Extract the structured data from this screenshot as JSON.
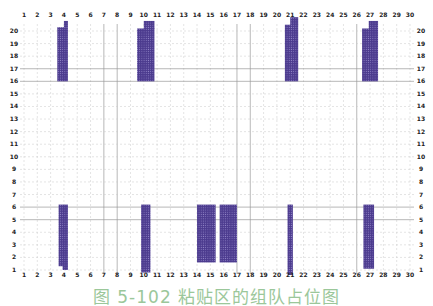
{
  "caption": "图 5-102 粘贴区的组队占位图",
  "colors": {
    "block": "#4b3a8e",
    "block_dot": "#8e82c4",
    "grid_solid": "#9a9a9a",
    "grid_dashed": "#c8c8c8",
    "caption": "#9bc79a"
  },
  "chart_data": {
    "type": "heatmap",
    "title": "图 5-102 粘贴区的组队占位图",
    "x_ticks": [
      1,
      2,
      3,
      4,
      5,
      6,
      7,
      8,
      9,
      10,
      11,
      12,
      13,
      14,
      15,
      16,
      17,
      18,
      19,
      20,
      21,
      22,
      23,
      24,
      25,
      26,
      27,
      28,
      29,
      30
    ],
    "y_ticks": [
      1,
      2,
      3,
      4,
      5,
      6,
      7,
      8,
      9,
      10,
      11,
      12,
      13,
      14,
      15,
      16,
      17,
      18,
      19,
      20
    ],
    "xlim": [
      1,
      30
    ],
    "ylim": [
      1,
      20
    ],
    "grid": true,
    "x_axis_positions": [
      "top",
      "bottom"
    ],
    "y_axis_positions": [
      "left",
      "right"
    ],
    "solid_gridlines_x": [
      7,
      8,
      17,
      18,
      26
    ],
    "solid_gridlines_y": [
      5,
      6,
      16,
      17
    ],
    "blocks": [
      {
        "x0": 3.5,
        "x1": 4.3,
        "y0": 16,
        "y1": 20.3,
        "top_step": {
          "x": 4.0,
          "y": 20.8
        }
      },
      {
        "x0": 9.5,
        "x1": 10.8,
        "y0": 16,
        "y1": 20.2,
        "top_step": {
          "x": 10.0,
          "y": 20.8
        }
      },
      {
        "x0": 20.6,
        "x1": 21.6,
        "y0": 16,
        "y1": 20.5,
        "top_step": {
          "x": 21.0,
          "y": 21.1
        }
      },
      {
        "x0": 26.4,
        "x1": 27.6,
        "y0": 16,
        "y1": 20.2,
        "top_step": {
          "x": 26.9,
          "y": 20.8
        }
      },
      {
        "x0": 3.6,
        "x1": 4.3,
        "y0": 1.3,
        "y1": 6.2,
        "bottom_step": {
          "x": 3.9,
          "y": 1.0
        }
      },
      {
        "x0": 9.8,
        "x1": 10.5,
        "y0": 0.8,
        "y1": 6.2
      },
      {
        "x0": 14.0,
        "x1": 15.4,
        "y0": 1.6,
        "y1": 6.2,
        "bottom_step": {
          "x": 14.2,
          "y": 1.7
        }
      },
      {
        "x0": 15.7,
        "x1": 17.0,
        "y0": 1.6,
        "y1": 6.2,
        "bottom_step": {
          "x": 16.8,
          "y": 1.9
        }
      },
      {
        "x0": 20.8,
        "x1": 21.2,
        "y0": 0.6,
        "y1": 6.2
      },
      {
        "x0": 26.5,
        "x1": 27.3,
        "y0": 1.1,
        "y1": 6.2
      }
    ]
  }
}
